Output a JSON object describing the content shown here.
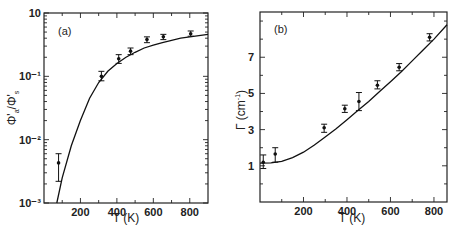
{
  "chart_data": [
    {
      "type": "scatter",
      "panel_label": "(a)",
      "xlabel": "T (K)",
      "ylabel_main": "Φ'",
      "ylabel_sub_num": "a",
      "ylabel_sep": "/Φ'",
      "ylabel_sub_den": "s",
      "xlim": [
        0,
        900
      ],
      "ylim_log10": [
        -3,
        0
      ],
      "yscale": "log",
      "x_ticks": [
        200,
        400,
        600,
        800
      ],
      "x_ticklabels": [
        "200",
        "400",
        "600",
        "800"
      ],
      "x_minor_ticks": [
        100,
        300,
        500,
        700
      ],
      "y_ticks_log10": [
        0,
        -1,
        -2,
        -3
      ],
      "y_ticklabels": [
        "10",
        "10⁻¹",
        "10⁻²",
        "10⁻³"
      ],
      "series": [
        {
          "name": "data",
          "x": [
            80,
            315,
            410,
            475,
            565,
            655,
            805
          ],
          "y": [
            0.0043,
            0.1,
            0.19,
            0.25,
            0.38,
            0.42,
            0.47
          ],
          "err_low": [
            0.0022,
            0.085,
            0.16,
            0.22,
            0.34,
            0.38,
            0.43
          ],
          "err_high": [
            0.006,
            0.12,
            0.22,
            0.28,
            0.42,
            0.46,
            0.52
          ]
        },
        {
          "name": "fit",
          "x": [
            70,
            100,
            150,
            200,
            250,
            300,
            350,
            400,
            450,
            500,
            550,
            600,
            650,
            700,
            750,
            800,
            850,
            900
          ],
          "y": [
            0.001,
            0.0025,
            0.008,
            0.02,
            0.045,
            0.08,
            0.12,
            0.16,
            0.2,
            0.24,
            0.28,
            0.31,
            0.34,
            0.37,
            0.4,
            0.42,
            0.44,
            0.46
          ]
        }
      ],
      "grid": false
    },
    {
      "type": "scatter",
      "panel_label": "(b)",
      "xlabel": "T (K)",
      "ylabel_main": "Γ (cm",
      "ylabel_sup": "-1",
      "ylabel_end": ")",
      "xlim": [
        0,
        860
      ],
      "ylim": [
        -1,
        9.5
      ],
      "x_ticks": [
        200,
        400,
        600,
        800
      ],
      "x_ticklabels": [
        "200",
        "400",
        "600",
        "800"
      ],
      "x_minor_ticks": [
        100,
        300,
        500,
        700
      ],
      "y_ticks": [
        1,
        3,
        5,
        7
      ],
      "y_ticklabels": [
        "1",
        "3",
        "5",
        "7"
      ],
      "y_minor_ticks": [
        0,
        2,
        4,
        6,
        8,
        9
      ],
      "series": [
        {
          "name": "data",
          "x": [
            15,
            70,
            295,
            390,
            455,
            540,
            640,
            780
          ],
          "y": [
            1.2,
            1.65,
            3.1,
            4.15,
            4.55,
            5.45,
            6.45,
            8.1
          ],
          "err_low": [
            0.85,
            1.2,
            2.85,
            3.95,
            4.05,
            5.25,
            6.25,
            7.9
          ],
          "err_high": [
            1.6,
            2.0,
            3.3,
            4.35,
            5.05,
            5.7,
            6.65,
            8.3
          ]
        },
        {
          "name": "fit",
          "x": [
            0,
            50,
            100,
            150,
            200,
            250,
            300,
            350,
            400,
            450,
            500,
            550,
            600,
            650,
            700,
            750,
            800,
            860
          ],
          "y": [
            1.15,
            1.16,
            1.25,
            1.45,
            1.75,
            2.15,
            2.6,
            3.05,
            3.55,
            4.05,
            4.55,
            5.1,
            5.65,
            6.2,
            6.8,
            7.4,
            8.0,
            8.8
          ]
        }
      ],
      "grid": false
    }
  ]
}
